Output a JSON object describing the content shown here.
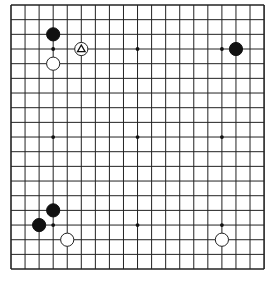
{
  "board": {
    "size": 19,
    "origin": {
      "x": 11,
      "y": 5
    },
    "spacing": {
      "x": 14.06,
      "y": 14.67
    },
    "line_color": "#222222",
    "background": "#ffffff",
    "star_points": [
      [
        3,
        3
      ],
      [
        9,
        3
      ],
      [
        15,
        3
      ],
      [
        3,
        9
      ],
      [
        9,
        9
      ],
      [
        15,
        9
      ],
      [
        3,
        15
      ],
      [
        9,
        15
      ],
      [
        15,
        15
      ]
    ],
    "stones": [
      {
        "col": 3,
        "row": 2,
        "color": "black"
      },
      {
        "col": 3,
        "row": 4,
        "color": "white"
      },
      {
        "col": 5,
        "row": 3,
        "color": "white",
        "marker": "triangle"
      },
      {
        "col": 16,
        "row": 3,
        "color": "black"
      },
      {
        "col": 3,
        "row": 14,
        "color": "black"
      },
      {
        "col": 2,
        "row": 15,
        "color": "black"
      },
      {
        "col": 4,
        "row": 16,
        "color": "white"
      },
      {
        "col": 15,
        "row": 16,
        "color": "white"
      }
    ]
  }
}
